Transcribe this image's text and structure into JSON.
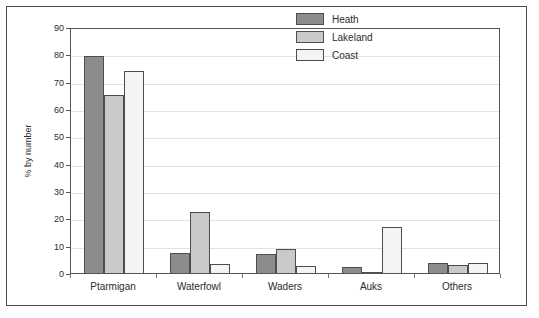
{
  "chart_data": {
    "type": "bar",
    "title": "",
    "xlabel": "",
    "ylabel": "% by number",
    "ylim": [
      0,
      90
    ],
    "ytick_step": 10,
    "yticks": [
      "0",
      "10",
      "20",
      "30",
      "40",
      "50",
      "60",
      "70",
      "80",
      "90"
    ],
    "grid": true,
    "legend_position": "top-right",
    "categories": [
      "Ptarmigan",
      "Waterfowl",
      "Waders",
      "Auks",
      "Others"
    ],
    "series": [
      {
        "name": "Heath",
        "color": "#8c8c8c",
        "values": [
          79.5,
          7.2,
          7.0,
          2.3,
          3.8
        ]
      },
      {
        "name": "Lakeland",
        "color": "#c9c9c9",
        "values": [
          65.3,
          22.5,
          8.7,
          0.4,
          3.0
        ]
      },
      {
        "name": "Coast",
        "color": "#f4f4f4",
        "values": [
          73.8,
          3.2,
          2.6,
          17.0,
          3.8
        ]
      }
    ]
  },
  "legend": {
    "items": [
      {
        "label": "Heath"
      },
      {
        "label": "Lakeland"
      },
      {
        "label": "Coast"
      }
    ]
  }
}
